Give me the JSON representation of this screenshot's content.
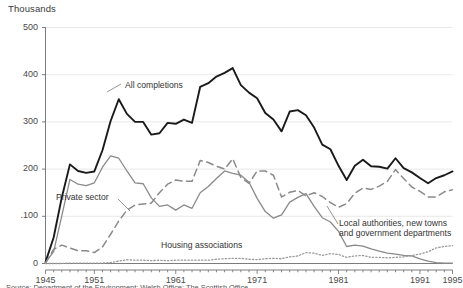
{
  "unit_title": "Thousands",
  "colors": {
    "all_completions": "#1a1a1a",
    "private_sector": "#8a8a8a",
    "local_authorities": "#8a8a8a",
    "housing_associations": "#9a9a9a",
    "gridline": "#e2e2e2",
    "axis": "#6d6d6d",
    "text": "#3a3a3a"
  },
  "labels": {
    "all_completions": "All completions",
    "private_sector": "Private sector",
    "local_authorities": "Local authorities, new towns and government departments",
    "housing_associations": "Housing associations"
  },
  "source_note": "Source: Department of the Environment; Welsh Office; The Scottish Office",
  "chart_data": {
    "type": "line",
    "title": "Thousands",
    "xlabel": "",
    "ylabel": "Thousands",
    "xlim": [
      1945,
      1995
    ],
    "ylim": [
      0,
      500
    ],
    "ytick_labels": [
      "0",
      ".100",
      "200",
      "300",
      "400",
      "500"
    ],
    "yticks": [
      0,
      100,
      200,
      300,
      400,
      500
    ],
    "xtick_labels": [
      "1945",
      "1951",
      "1961",
      "1971",
      "1981",
      "1991",
      "1995"
    ],
    "xticks": [
      1945,
      1951,
      1961,
      1971,
      1981,
      1991,
      1995
    ],
    "minor_xtick_interval": 1,
    "grid": "horizontal",
    "legend": "inline-annotations",
    "x": [
      1945,
      1946,
      1947,
      1948,
      1949,
      1950,
      1951,
      1952,
      1953,
      1954,
      1955,
      1956,
      1957,
      1958,
      1959,
      1960,
      1961,
      1962,
      1963,
      1964,
      1965,
      1966,
      1967,
      1968,
      1969,
      1970,
      1971,
      1972,
      1973,
      1974,
      1975,
      1976,
      1977,
      1978,
      1979,
      1980,
      1981,
      1982,
      1983,
      1984,
      1985,
      1986,
      1987,
      1988,
      1989,
      1990,
      1991,
      1992,
      1993,
      1994,
      1995
    ],
    "series": [
      {
        "name": "All completions",
        "style": "solid",
        "color": "#1a1a1a",
        "width": 1.9,
        "values": [
          3,
          55,
          140,
          210,
          196,
          192,
          195,
          240,
          302,
          348,
          317,
          300,
          300,
          273,
          276,
          298,
          296,
          305,
          298,
          374,
          382,
          396,
          404,
          414,
          378,
          362,
          350,
          319,
          305,
          280,
          322,
          325,
          314,
          288,
          252,
          242,
          207,
          177,
          207,
          220,
          206,
          205,
          201,
          223,
          202,
          193,
          181,
          170,
          181,
          187,
          195
        ]
      },
      {
        "name": "Private sector",
        "style": "dashed",
        "color": "#8a8a8a",
        "width": 1.5,
        "values": [
          1,
          30,
          39,
          33,
          27,
          27,
          23,
          35,
          62,
          90,
          113,
          124,
          126,
          128,
          150,
          168,
          177,
          174,
          174,
          218,
          214,
          206,
          200,
          222,
          182,
          170,
          196,
          196,
          187,
          141,
          151,
          155,
          143,
          150,
          142,
          129,
          119,
          127,
          149,
          160,
          157,
          164,
          174,
          199,
          180,
          162,
          153,
          141,
          141,
          152,
          156
        ]
      },
      {
        "name": "Local authorities, new towns and government departments",
        "style": "solid",
        "color": "#8a8a8a",
        "width": 1.3,
        "values": [
          2,
          25,
          101,
          178,
          168,
          165,
          171,
          204,
          228,
          223,
          196,
          171,
          169,
          139,
          121,
          124,
          113,
          124,
          117,
          150,
          163,
          180,
          196,
          191,
          187,
          172,
          138,
          110,
          96,
          103,
          130,
          140,
          148,
          121,
          97,
          88,
          68,
          36,
          39,
          37,
          31,
          26,
          22,
          20,
          17,
          16,
          10,
          5,
          2,
          1,
          1
        ]
      },
      {
        "name": "Housing associations",
        "style": "dotted",
        "color": "#9a9a9a",
        "width": 1.3,
        "values": [
          0,
          0,
          0,
          1,
          1,
          1,
          1,
          1,
          2,
          5,
          8,
          7,
          7,
          6,
          7,
          6,
          7,
          7,
          7,
          7,
          7,
          9,
          10,
          11,
          11,
          9,
          8,
          10,
          11,
          10,
          14,
          16,
          23,
          22,
          17,
          21,
          19,
          13,
          16,
          17,
          13,
          13,
          12,
          13,
          14,
          17,
          20,
          25,
          33,
          36,
          38
        ]
      }
    ]
  }
}
